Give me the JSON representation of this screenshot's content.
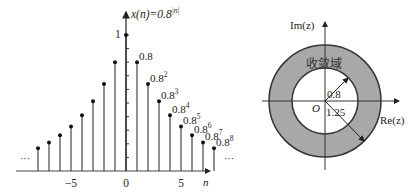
{
  "chart_data": [
    {
      "type": "stem",
      "title": "x(n)=0.8^|n|",
      "ylabel": "x(n)=0.8",
      "ylabel_exp": "|n|",
      "xlabel": "n",
      "x": [
        -8,
        -7,
        -6,
        -5,
        -4,
        -3,
        -2,
        -1,
        0,
        1,
        2,
        3,
        4,
        5,
        6,
        7,
        8
      ],
      "values": [
        0.168,
        0.21,
        0.262,
        0.328,
        0.41,
        0.512,
        0.64,
        0.8,
        1,
        0.8,
        0.64,
        0.512,
        0.41,
        0.328,
        0.262,
        0.21,
        0.168
      ],
      "xticks": [
        -5,
        0,
        5
      ],
      "xtick_labels": [
        "−5",
        "0",
        "5"
      ],
      "ytick_label": "1",
      "point_labels": [
        {
          "n": 1,
          "base": "0.8",
          "exp": ""
        },
        {
          "n": 2,
          "base": "0.8",
          "exp": "2"
        },
        {
          "n": 3,
          "base": "0.8",
          "exp": "3"
        },
        {
          "n": 4,
          "base": "0.8",
          "exp": "4"
        },
        {
          "n": 5,
          "base": "0.8",
          "exp": "5"
        },
        {
          "n": 6,
          "base": "0.8",
          "exp": "6"
        },
        {
          "n": 7,
          "base": "0.8",
          "exp": "7"
        },
        {
          "n": 8,
          "base": "0.8",
          "exp": "8"
        }
      ],
      "ellipsis_left": "···",
      "ellipsis_right": "···"
    },
    {
      "type": "region-diagram",
      "title": "ROC in z-plane",
      "xlabel": "Re(z)",
      "ylabel": "Im(z)",
      "origin_label": "O",
      "region_label": "收敛域",
      "inner_radius": 0.8,
      "outer_radius": 1.25,
      "inner_radius_label": "0.8",
      "outer_radius_label": "1.25",
      "fill_color": "#a8a8a8"
    }
  ]
}
